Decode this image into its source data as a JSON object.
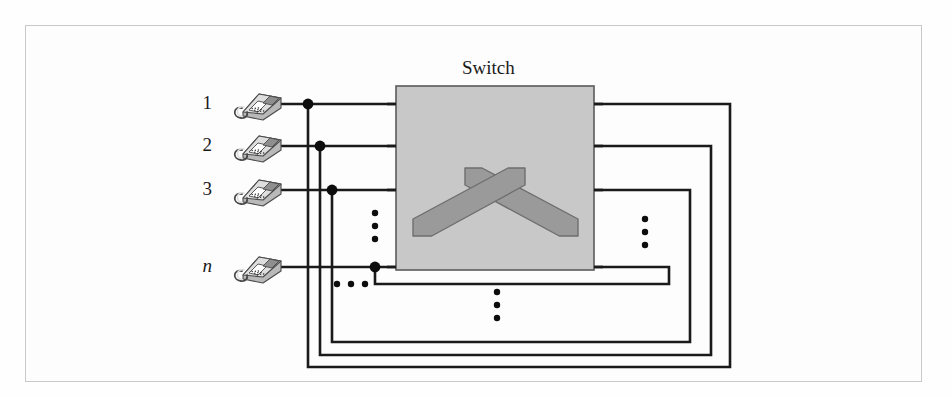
{
  "figure": {
    "title": "Switch",
    "type": "telephone-switching-diagram",
    "frame": {
      "x": 25,
      "y": 25,
      "width": 897,
      "height": 357,
      "border_color": "#c9c9c9"
    },
    "background": "#fdfdfd"
  },
  "colors": {
    "line": "#1a1a1a",
    "switch_fill": "#c8c8c8",
    "switch_border": "#5a5a5a",
    "switch_symbol": "#9a9a9a",
    "switch_symbol_border": "#6e6e6e",
    "phone_body": "#b9b9b9",
    "phone_dark": "#8f8f8f",
    "phone_light": "#dedede",
    "phone_outline": "#4a4a4a",
    "dot": "#0d0d0d",
    "frame": "#c9c9c9",
    "text": "#1a1a1a"
  },
  "switch_box": {
    "label": "Switch",
    "label_x": 462,
    "label_y": 57,
    "x": 396,
    "y": 86,
    "width": 198,
    "height": 184
  },
  "switch_symbol": {
    "description": "two crossed thick bands forming an X at top then angling down to horizontal feet",
    "left_foot_x": 413,
    "right_foot_x": 578,
    "cross_x": 495,
    "cross_y": 200,
    "foot_y": 236
  },
  "rows": [
    {
      "id": "row-1",
      "label": "1",
      "italic": false,
      "label_x": 212,
      "label_y": 93,
      "phone_x": 229,
      "phone_y": 86,
      "line_y": 104,
      "dot_x": 308,
      "right_turn_x": 730,
      "bottom_y": 367,
      "switch_left_x": 396,
      "switch_right_x": 594
    },
    {
      "id": "row-2",
      "label": "2",
      "italic": false,
      "label_x": 212,
      "label_y": 135,
      "phone_x": 229,
      "phone_y": 128,
      "line_y": 146,
      "dot_x": 320,
      "right_turn_x": 711,
      "bottom_y": 355,
      "switch_left_x": 396,
      "switch_right_x": 594
    },
    {
      "id": "row-3",
      "label": "3",
      "italic": false,
      "label_x": 212,
      "label_y": 179,
      "phone_x": 229,
      "phone_y": 172,
      "line_y": 190,
      "dot_x": 332,
      "right_turn_x": 690,
      "bottom_y": 342,
      "switch_left_x": 396,
      "switch_right_x": 594
    },
    {
      "id": "row-n",
      "label": "n",
      "italic": true,
      "label_x": 212,
      "label_y": 256,
      "phone_x": 229,
      "phone_y": 249,
      "line_y": 267,
      "dot_x": 375,
      "right_turn_x": 669,
      "bottom_y": 284,
      "switch_left_x": 396,
      "switch_right_x": 594
    }
  ],
  "ellipses": [
    {
      "id": "ellipsis-left-vertical",
      "orientation": "vertical",
      "x": 375,
      "y_start": 213,
      "gap": 13,
      "count": 3,
      "radius": 3.2
    },
    {
      "id": "ellipsis-left-horizontal",
      "orientation": "horizontal",
      "y": 284,
      "x_start": 337,
      "gap": 14,
      "count": 3,
      "radius": 3.2
    },
    {
      "id": "ellipsis-right-vertical",
      "orientation": "vertical",
      "x": 645,
      "y_start": 219,
      "gap": 13,
      "count": 3,
      "radius": 3.2
    },
    {
      "id": "ellipsis-bottom-vertical",
      "orientation": "vertical",
      "x": 497,
      "y_start": 292,
      "gap": 13,
      "count": 3,
      "radius": 3.2
    }
  ],
  "line_width": 2.6,
  "dot_radius": 5.4
}
